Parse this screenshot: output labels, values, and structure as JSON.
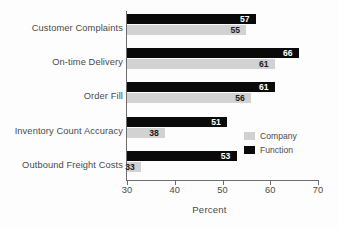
{
  "chart_data": {
    "type": "bar",
    "orientation": "horizontal",
    "title": "",
    "xlabel": "Percent",
    "ylabel": "",
    "xlim": [
      30,
      70
    ],
    "xticks": [
      30,
      40,
      50,
      60,
      70
    ],
    "grid": false,
    "legend_position": "center-right",
    "categories": [
      "Customer Complaints",
      "On-time Delivery",
      "Order Fill",
      "Inventory Count Accuracy",
      "Outbound Freight Costs"
    ],
    "series": [
      {
        "name": "Function",
        "color": "#0a0a0a",
        "values": [
          57,
          66,
          61,
          51,
          53
        ]
      },
      {
        "name": "Company",
        "color": "#d2d2d2",
        "values": [
          55,
          61,
          56,
          38,
          33
        ]
      }
    ]
  },
  "legend": {
    "items": [
      {
        "label": "Company",
        "color": "#d2d2d2"
      },
      {
        "label": "Function",
        "color": "#0a0a0a"
      }
    ]
  },
  "axis": {
    "x_title": "Percent",
    "tick_labels": [
      "30",
      "40",
      "50",
      "60",
      "70"
    ]
  },
  "values_text": {
    "function": [
      "57",
      "66",
      "61",
      "51",
      "53"
    ],
    "company": [
      "55",
      "61",
      "56",
      "38",
      "33"
    ]
  }
}
